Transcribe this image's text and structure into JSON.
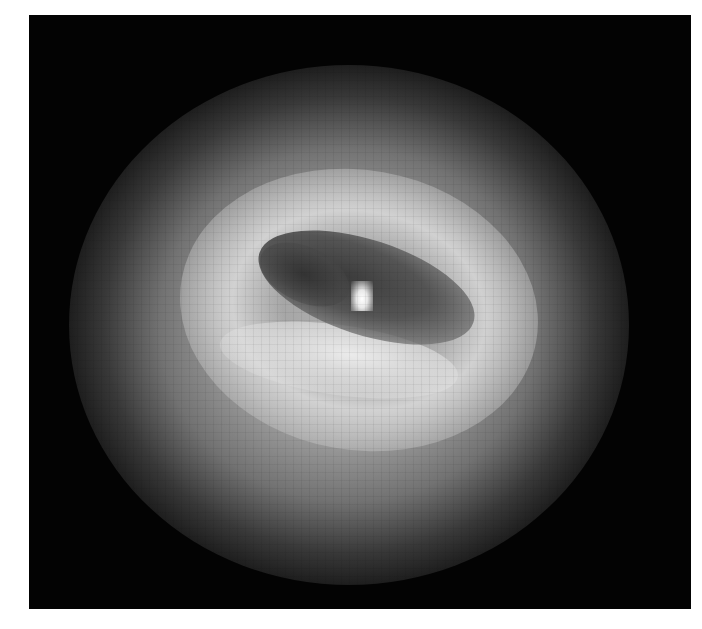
{
  "image": {
    "kind": "grayscale astronomical image",
    "subject": "ring-shaped disk with dark inner cavity and bright central point source",
    "alt": "Grayscale pixelated image of a circumstellar ring disk with a dark elliptical cavity and a bright central point",
    "colors": {
      "background": "#030303",
      "ring": "#d7d7d7",
      "cavity": "#4a4a4a",
      "core": "#ffffff",
      "page": "#ffffff"
    }
  }
}
